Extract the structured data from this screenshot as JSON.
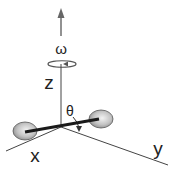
{
  "diagram": {
    "labels": {
      "omega": "ω",
      "z": "z",
      "x": "x",
      "y": "y",
      "theta": "θ"
    },
    "colors": {
      "axis": "#444444",
      "bond": "#1a1a1a",
      "sphere_fill": "#c8c8c8",
      "sphere_stroke": "#555555",
      "arrow": "#666666"
    }
  }
}
